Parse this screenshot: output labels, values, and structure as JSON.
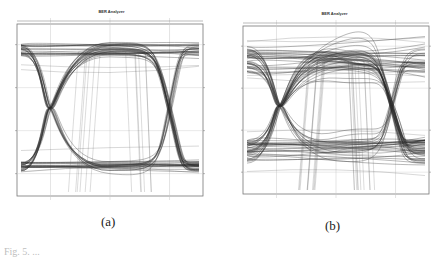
{
  "chart_data": [
    {
      "type": "line",
      "subtype": "eye-diagram",
      "panel_label": "(a)",
      "title": "BER Analyzer",
      "xlabel": "",
      "ylabel": "",
      "grid": true,
      "legend": "none",
      "frame": {
        "left": 17,
        "top": 24,
        "right": 203,
        "bottom": 196
      },
      "crossings_x_frac": [
        0.18,
        0.82
      ],
      "eye": {
        "high_level_frac": 0.15,
        "low_level_frac": 0.83,
        "high_spread": 0.07,
        "low_spread": 0.06,
        "opening": "wide"
      },
      "traces": 60,
      "stray_traces": 6
    },
    {
      "type": "line",
      "subtype": "eye-diagram",
      "panel_label": "(b)",
      "title": "BER Analyzer",
      "xlabel": "",
      "ylabel": "",
      "grid": true,
      "legend": "none",
      "frame": {
        "left": 243,
        "top": 26,
        "right": 429,
        "bottom": 194
      },
      "crossings_x_frac": [
        0.2,
        0.8
      ],
      "eye": {
        "high_level_frac": 0.2,
        "low_level_frac": 0.75,
        "high_spread": 0.16,
        "low_spread": 0.14,
        "opening": "narrower, noisy"
      },
      "traces": 80,
      "stray_traces": 10
    }
  ],
  "figure": {
    "panels": [
      {
        "title": "BER Analyzer",
        "sublabel": "(a)"
      },
      {
        "title": "BER Analyzer",
        "sublabel": "(b)"
      }
    ],
    "caption": "Fig. 5. ..."
  },
  "colors": {
    "trace": "#2a2a2a",
    "frame": "#777777",
    "grid": "#c8c8c8"
  }
}
